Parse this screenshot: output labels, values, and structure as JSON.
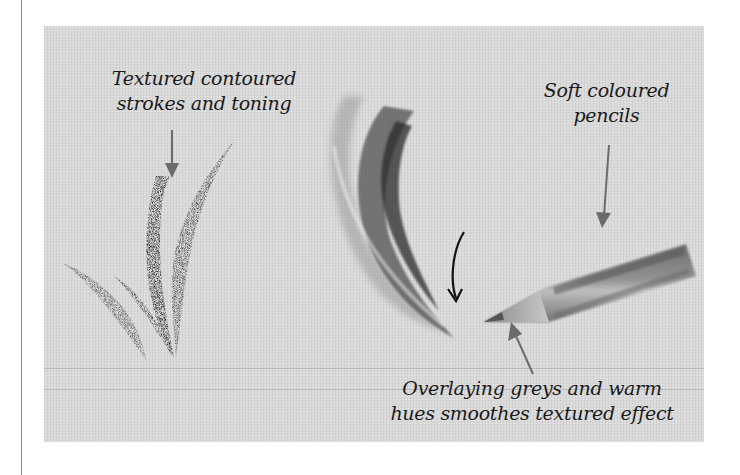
{
  "figure": {
    "panel_background": "#d9d9d9",
    "ink_color": "#1a1a1a",
    "arrow_color": "#6b6b6b",
    "annotations": [
      {
        "id": "textured-strokes",
        "lines": [
          "Textured contoured",
          "strokes and toning"
        ]
      },
      {
        "id": "soft-pencils",
        "lines": [
          "Soft coloured",
          "pencils"
        ]
      },
      {
        "id": "overlaying-greys",
        "lines": [
          "Overlaying greys and warm",
          "hues smoothes textured effect"
        ]
      }
    ],
    "illustrations": [
      {
        "name": "textured-contoured-stroke",
        "description": "Dark grainy curved pencil strokes"
      },
      {
        "name": "blended-soft-stroke",
        "description": "Smooth blended grey curved strokes"
      },
      {
        "name": "coloured-pencil",
        "description": "Soft coloured pencil pointing left"
      }
    ]
  }
}
